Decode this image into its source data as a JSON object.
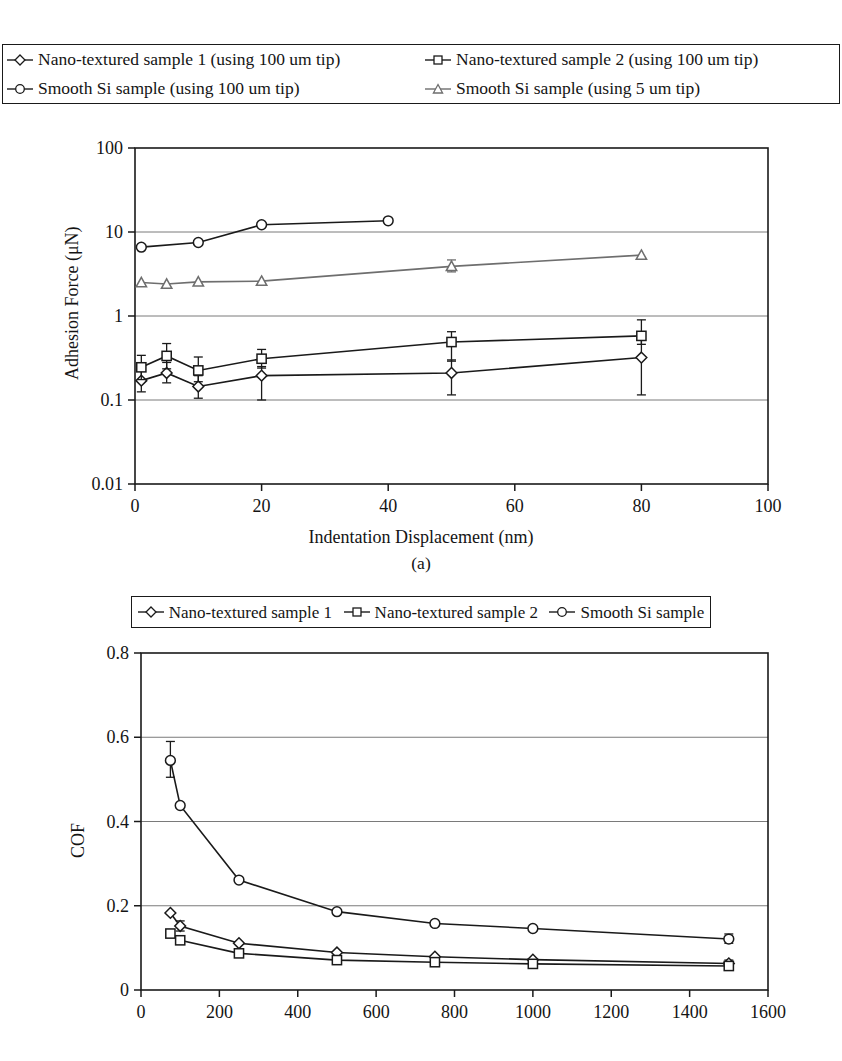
{
  "figure": {
    "caption_a": "(a)"
  },
  "legends": {
    "top": {
      "entries": [
        {
          "label": "Nano-textured sample 1 (using 100 um tip)",
          "marker": "diamond",
          "color": "#1a1a1a"
        },
        {
          "label": "Nano-textured sample 2 (using 100 um tip)",
          "marker": "square",
          "color": "#1a1a1a"
        },
        {
          "label": "Smooth Si sample (using 100 um tip)",
          "marker": "circle",
          "color": "#1a1a1a"
        },
        {
          "label": "Smooth Si sample (using 5 um tip)",
          "marker": "triangle",
          "color": "#6e6e6e"
        }
      ]
    },
    "bottom": {
      "entries": [
        {
          "label": "Nano-textured sample 1",
          "marker": "diamond",
          "color": "#1a1a1a"
        },
        {
          "label": "Nano-textured sample 2",
          "marker": "square",
          "color": "#1a1a1a"
        },
        {
          "label": "Smooth Si sample",
          "marker": "circle",
          "color": "#1a1a1a"
        }
      ]
    }
  },
  "chart_data": [
    {
      "id": "adhesion",
      "type": "line",
      "title": "",
      "xlabel": "Indentation Displacement (nm)",
      "ylabel": "Adhesion Force (μN)",
      "xscale": "linear",
      "yscale": "log",
      "xlim": [
        0,
        100
      ],
      "ylim": [
        0.01,
        100
      ],
      "xticks": [
        0,
        20,
        40,
        60,
        80,
        100
      ],
      "xticklabels": [
        "0",
        "20",
        "40",
        "60",
        "80",
        "100"
      ],
      "yticks": [
        0.01,
        0.1,
        1,
        10,
        100
      ],
      "yticklabels": [
        "0.01",
        "0.1",
        "1",
        "10",
        "100"
      ],
      "grid": "y",
      "series": [
        {
          "name": "Nano-textured sample 1 (using 100 um tip)",
          "marker": "diamond",
          "color": "#1a1a1a",
          "x": [
            1,
            5,
            10,
            20,
            50,
            80
          ],
          "y": [
            0.17,
            0.21,
            0.145,
            0.195,
            0.21,
            0.32
          ],
          "yerr_low": [
            0.045,
            0.05,
            0.04,
            0.095,
            0.095,
            0.205
          ],
          "yerr_high": [
            0.06,
            0.07,
            0.05,
            0.055,
            0.09,
            0.26
          ]
        },
        {
          "name": "Nano-textured sample 2 (using 100 um tip)",
          "marker": "square",
          "color": "#1a1a1a",
          "x": [
            1,
            5,
            10,
            20,
            50,
            80
          ],
          "y": [
            0.245,
            0.335,
            0.225,
            0.31,
            0.49,
            0.58
          ],
          "yerr_low": [
            0.07,
            0.1,
            0.06,
            0.07,
            0.2,
            0.12
          ],
          "yerr_high": [
            0.095,
            0.135,
            0.1,
            0.09,
            0.16,
            0.32
          ]
        },
        {
          "name": "Smooth Si sample (using 100 um tip)",
          "marker": "circle",
          "color": "#1a1a1a",
          "x": [
            1,
            10,
            20,
            40
          ],
          "y": [
            6.6,
            7.5,
            12.2,
            13.6
          ],
          "yerr_low": [
            0,
            0,
            0,
            0
          ],
          "yerr_high": [
            0,
            0,
            0,
            0
          ]
        },
        {
          "name": "Smooth Si sample (using 5 um tip)",
          "marker": "triangle",
          "color": "#6e6e6e",
          "x": [
            1,
            5,
            10,
            20,
            50,
            80
          ],
          "y": [
            2.5,
            2.4,
            2.55,
            2.6,
            3.9,
            5.3
          ],
          "yerr_low": [
            0,
            0,
            0,
            0,
            0.55,
            0
          ],
          "yerr_high": [
            0,
            0,
            0,
            0,
            0.75,
            0
          ]
        }
      ]
    },
    {
      "id": "cof",
      "type": "line",
      "title": "",
      "xlabel": "",
      "ylabel": "COF",
      "xscale": "linear",
      "yscale": "linear",
      "xlim": [
        0,
        1600
      ],
      "ylim": [
        0,
        0.8
      ],
      "xticks": [
        0,
        200,
        400,
        600,
        800,
        1000,
        1200,
        1400,
        1600
      ],
      "xticklabels": [
        "0",
        "200",
        "400",
        "600",
        "800",
        "1000",
        "1200",
        "1400",
        "1600"
      ],
      "yticks": [
        0,
        0.2,
        0.4,
        0.6,
        0.8
      ],
      "yticklabels": [
        "0",
        "0.2",
        "0.4",
        "0.6",
        "0.8"
      ],
      "grid": "y",
      "series": [
        {
          "name": "Nano-textured sample 1",
          "marker": "diamond",
          "color": "#1a1a1a",
          "x": [
            75,
            100,
            250,
            500,
            750,
            1000,
            1500
          ],
          "y": [
            0.183,
            0.152,
            0.111,
            0.089,
            0.079,
            0.072,
            0.063
          ],
          "yerr_low": [
            0,
            0.012,
            0,
            0,
            0,
            0,
            0.008
          ],
          "yerr_high": [
            0,
            0.012,
            0,
            0,
            0,
            0,
            0.008
          ]
        },
        {
          "name": "Nano-textured sample 2",
          "marker": "square",
          "color": "#1a1a1a",
          "x": [
            75,
            100,
            250,
            500,
            750,
            1000,
            1500
          ],
          "y": [
            0.134,
            0.118,
            0.087,
            0.071,
            0.066,
            0.062,
            0.057
          ],
          "yerr_low": [
            0,
            0,
            0,
            0,
            0,
            0,
            0
          ],
          "yerr_high": [
            0,
            0,
            0,
            0,
            0,
            0,
            0
          ]
        },
        {
          "name": "Smooth Si sample",
          "marker": "circle",
          "color": "#1a1a1a",
          "x": [
            75,
            100,
            250,
            500,
            750,
            1000,
            1500
          ],
          "y": [
            0.545,
            0.438,
            0.261,
            0.186,
            0.158,
            0.146,
            0.121
          ],
          "yerr_low": [
            0.04,
            0,
            0,
            0,
            0,
            0,
            0.01
          ],
          "yerr_high": [
            0.045,
            0,
            0,
            0,
            0,
            0,
            0.012
          ]
        }
      ]
    }
  ]
}
